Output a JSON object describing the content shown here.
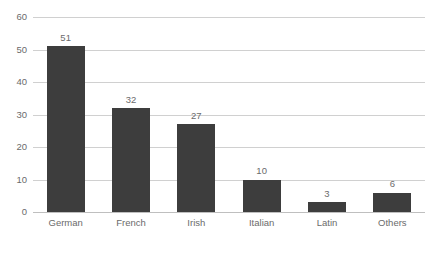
{
  "chart_data": {
    "type": "bar",
    "title": "",
    "subtitle": "",
    "xlabel": "",
    "ylabel": "",
    "categories": [
      "German",
      "French",
      "Irish",
      "Italian",
      "Latin",
      "Others"
    ],
    "values": [
      51,
      32,
      27,
      10,
      3,
      6
    ],
    "data_labels": [
      "51",
      "32",
      "27",
      "10",
      "3",
      "6"
    ],
    "ylim": [
      0,
      60
    ],
    "yticks": [
      0,
      10,
      20,
      30,
      40,
      50,
      60
    ],
    "ytick_labels": [
      "0",
      "10",
      "20",
      "30",
      "40",
      "50",
      "60"
    ],
    "grid": true,
    "grid_axis": "y",
    "legend": false,
    "legend_position": "none",
    "bar_color": "#3d3d3d",
    "gridline_color": "#d0d0d0",
    "axis_color": "#bfbfbf",
    "text_color": "#6b6b6b"
  },
  "caption": {
    "text": ""
  }
}
